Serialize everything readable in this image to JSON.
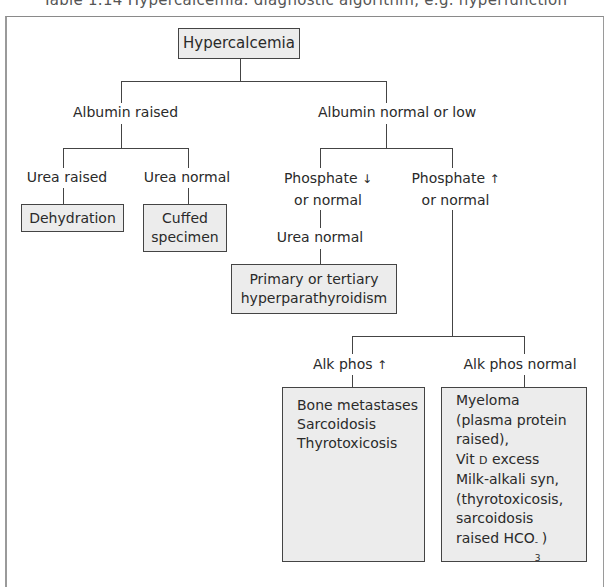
{
  "header": {
    "cropped_text": "Table 1.14 Hypercalcemia: diagnostic algorithm, e.g. hyperfunction"
  },
  "diagram": {
    "root": "Hypercalcemia",
    "albumin_raised": "Albumin raised",
    "albumin_normal": "Albumin normal or low",
    "urea_raised": "Urea raised",
    "urea_normal_left": "Urea normal",
    "dehydration": "Dehydration",
    "cuffed_line1": "Cuffed",
    "cuffed_line2": "specimen",
    "phos_low_line1": "Phosphate",
    "phos_low_arrow": "↓",
    "phos_low_line2": "or normal",
    "phos_high_line1": "Phosphate",
    "phos_high_arrow": "↑",
    "phos_high_line2": "or normal",
    "urea_normal_mid": "Urea normal",
    "hpt_line1": "Primary or tertiary",
    "hpt_line2": "hyperparathyroidism",
    "alk_high": "Alk phos",
    "alk_high_arrow": "↑",
    "alk_normal": "Alk phos normal",
    "left_result": [
      "Bone metastases",
      "Sarcoidosis",
      "Thyrotoxicosis"
    ],
    "right_result": {
      "l1": "Myeloma",
      "l2": "(plasma protein",
      "l3": "raised),",
      "l4a": "Vit ",
      "l4b": "D",
      "l4c": " excess",
      "l5": "Milk-alkali syn,",
      "l6": "(thyrotoxicosis,",
      "l7": "sarcoidosis",
      "l8a": "raised HCO",
      "l8sup": "-",
      "l8sub": "3",
      "l8b": ")"
    }
  },
  "colors": {
    "box_fill": "#ececec",
    "box_border": "#444444",
    "line": "#444444",
    "text": "#2a2a2a"
  }
}
